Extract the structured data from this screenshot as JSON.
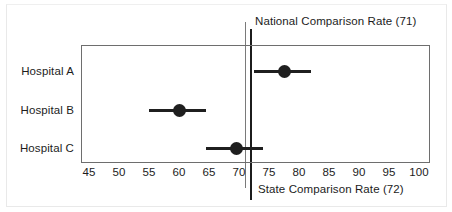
{
  "chart_data": {
    "type": "scatter",
    "title": "",
    "xlabel": "",
    "ylabel": "",
    "xlim": [
      43,
      101
    ],
    "xticks": [
      45,
      50,
      55,
      60,
      65,
      70,
      75,
      80,
      85,
      90,
      95,
      100
    ],
    "xtick_labels": [
      "45",
      "50",
      "55",
      "60",
      "65",
      "70",
      "75",
      "80",
      "85",
      "90",
      "95",
      "100"
    ],
    "grid": false,
    "legend": "none",
    "categories": [
      "Hospital A",
      "Hospital B",
      "Hospital C"
    ],
    "series": [
      {
        "name": "Rate",
        "points": [
          {
            "category": "Hospital A",
            "value": 77.5,
            "ci_low": 72.5,
            "ci_high": 82.0
          },
          {
            "category": "Hospital B",
            "value": 60.0,
            "ci_low": 55.0,
            "ci_high": 64.5
          },
          {
            "category": "Hospital C",
            "value": 69.5,
            "ci_low": 64.5,
            "ci_high": 74.0
          }
        ]
      }
    ],
    "reference_lines": [
      {
        "name": "national",
        "label": "National Comparison Rate (71)",
        "value": 71,
        "color": "#7a7a7a",
        "label_position": "top"
      },
      {
        "name": "state",
        "label": "State Comparison Rate (72)",
        "value": 72,
        "color": "#1c1c1c",
        "label_position": "bottom"
      }
    ],
    "colors": {
      "marker": "#1f1f1f",
      "ci": "#1f1f1f",
      "plot_border": "#6e6e6e",
      "text": "#1c1c1c"
    }
  },
  "rows": [
    {
      "label": "Hospital A"
    },
    {
      "label": "Hospital B"
    },
    {
      "label": "Hospital C"
    }
  ],
  "reference": {
    "national_label": "National Comparison Rate (71)",
    "state_label": "State Comparison Rate (72)"
  },
  "axis": {
    "ticks": [
      "45",
      "50",
      "55",
      "60",
      "65",
      "70",
      "75",
      "80",
      "85",
      "90",
      "95",
      "100"
    ]
  }
}
